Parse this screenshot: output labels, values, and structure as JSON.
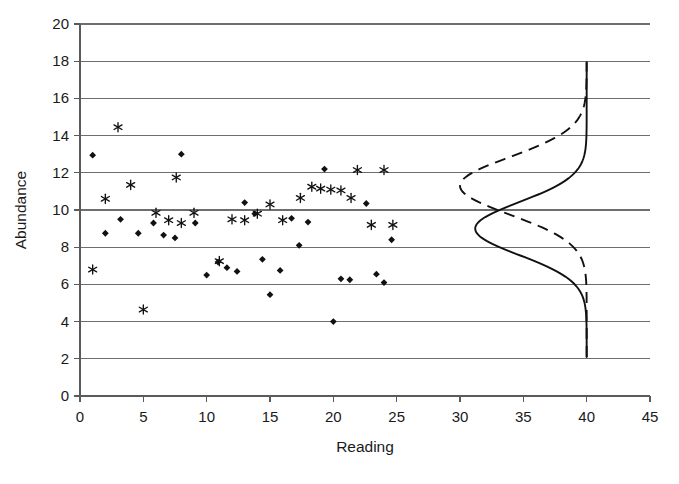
{
  "chart_data": {
    "type": "scatter",
    "title": "",
    "xlabel": "Reading",
    "ylabel": "Abundance",
    "xlim": [
      0,
      45
    ],
    "ylim": [
      0,
      20
    ],
    "xticks": [
      0,
      5,
      10,
      15,
      20,
      25,
      30,
      35,
      40,
      45
    ],
    "yticks": [
      0,
      2,
      4,
      6,
      8,
      10,
      12,
      14,
      16,
      18,
      20
    ],
    "grid": "horizontal",
    "legend": "none",
    "series": [
      {
        "name": "diamond-series",
        "marker": "diamond",
        "points": [
          [
            1.0,
            12.95
          ],
          [
            2.0,
            8.75
          ],
          [
            3.2,
            9.5
          ],
          [
            4.6,
            8.75
          ],
          [
            5.8,
            9.3
          ],
          [
            6.6,
            8.65
          ],
          [
            7.5,
            8.5
          ],
          [
            8.0,
            13.0
          ],
          [
            9.1,
            9.3
          ],
          [
            10.0,
            6.5
          ],
          [
            10.9,
            7.2
          ],
          [
            11.6,
            6.9
          ],
          [
            12.4,
            6.7
          ],
          [
            13.0,
            10.4
          ],
          [
            13.8,
            9.8
          ],
          [
            14.4,
            7.35
          ],
          [
            15.0,
            5.45
          ],
          [
            15.8,
            6.75
          ],
          [
            16.7,
            9.55
          ],
          [
            17.3,
            8.1
          ],
          [
            18.0,
            9.35
          ],
          [
            19.3,
            12.2
          ],
          [
            20.0,
            4.0
          ],
          [
            20.6,
            6.3
          ],
          [
            21.3,
            6.25
          ],
          [
            22.6,
            10.35
          ],
          [
            23.4,
            6.55
          ],
          [
            24.0,
            6.1
          ],
          [
            24.6,
            8.4
          ]
        ]
      },
      {
        "name": "asterisk-series",
        "marker": "asterisk",
        "points": [
          [
            1.0,
            6.8
          ],
          [
            2.0,
            10.6
          ],
          [
            3.0,
            14.45
          ],
          [
            4.0,
            11.35
          ],
          [
            5.0,
            4.65
          ],
          [
            6.0,
            9.85
          ],
          [
            7.0,
            9.45
          ],
          [
            7.6,
            11.75
          ],
          [
            8.0,
            9.3
          ],
          [
            9.0,
            9.85
          ],
          [
            11.0,
            7.25
          ],
          [
            12.0,
            9.5
          ],
          [
            13.0,
            9.45
          ],
          [
            14.0,
            9.8
          ],
          [
            15.0,
            10.3
          ],
          [
            16.0,
            9.45
          ],
          [
            17.4,
            10.65
          ],
          [
            18.3,
            11.25
          ],
          [
            19.0,
            11.15
          ],
          [
            19.8,
            11.1
          ],
          [
            20.6,
            11.05
          ],
          [
            21.4,
            10.65
          ],
          [
            21.9,
            12.15
          ],
          [
            23.0,
            9.2
          ],
          [
            24.0,
            12.15
          ],
          [
            24.7,
            9.2
          ]
        ]
      }
    ],
    "curves": [
      {
        "name": "solid-distribution-curve",
        "style": "solid",
        "description": "vertical bell curve with baseline at Reading 40, peak toward Reading 31 at Abundance 9",
        "baseline_reading": 40,
        "peak_reading": 31.2,
        "peak_abundance": 9.0,
        "range_abundance": [
          2.1,
          18.0
        ]
      },
      {
        "name": "dashed-distribution-curve",
        "style": "dashed",
        "description": "vertical bell curve with baseline at Reading 40, peak toward Reading 30 at Abundance 11.3",
        "baseline_reading": 40,
        "peak_reading": 30.0,
        "peak_abundance": 11.3,
        "range_abundance": [
          2.1,
          18.0
        ]
      }
    ]
  },
  "axes": {
    "y_label": "Abundance",
    "x_label": "Reading",
    "y_tick_labels": [
      "0",
      "2",
      "4",
      "6",
      "8",
      "10",
      "12",
      "14",
      "16",
      "18",
      "20"
    ],
    "x_tick_labels": [
      "0",
      "5",
      "10",
      "15",
      "20",
      "25",
      "30",
      "35",
      "40",
      "45"
    ]
  },
  "colors": {
    "marker": "#111111",
    "gridline": "#6e6e6e",
    "axis": "#5a5a5a",
    "background": "#ffffff"
  }
}
